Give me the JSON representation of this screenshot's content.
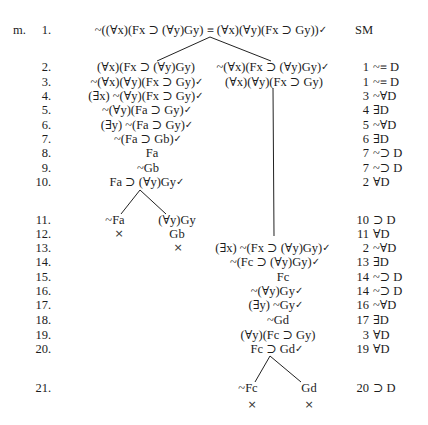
{
  "problem": {
    "label": "m."
  },
  "symbols": {
    "check": "✓"
  },
  "rows": [
    {
      "num": "1.",
      "nodes": [
        {
          "text": "~((∀x)(Fx ⊃ (∀y)Gy) ≡ (∀x)(∀y)(Fx ⊃ Gy))",
          "checked": true
        }
      ],
      "just": {
        "text": "SM"
      }
    },
    {
      "num": "2.",
      "nodes": [
        {
          "text": "(∀x)(Fx ⊃ (∀y)Gy)"
        },
        {
          "text": "~(∀x)(Fx ⊃ (∀y)Gy)",
          "checked": true
        }
      ],
      "just": {
        "ref": "1",
        "rule": "~≡ D"
      }
    },
    {
      "num": "3.",
      "nodes": [
        {
          "text": "~(∀x)(∀y)(Fx ⊃ Gy)",
          "checked": true
        },
        {
          "text": "(∀x)(∀y)(Fx ⊃ Gy)"
        }
      ],
      "just": {
        "ref": "1",
        "rule": "~≡ D"
      }
    },
    {
      "num": "4.",
      "nodes": [
        {
          "text": "(∃x) ~(∀y)(Fx ⊃ Gy)",
          "checked": true
        }
      ],
      "just": {
        "ref": "3",
        "rule": "~∀D"
      }
    },
    {
      "num": "5.",
      "nodes": [
        {
          "text": "~(∀y)(Fa ⊃ Gy)",
          "checked": true
        }
      ],
      "just": {
        "ref": "4",
        "rule": "∃D"
      }
    },
    {
      "num": "6.",
      "nodes": [
        {
          "text": "(∃y) ~(Fa ⊃ Gy)",
          "checked": true
        }
      ],
      "just": {
        "ref": "5",
        "rule": "~∀D"
      }
    },
    {
      "num": "7.",
      "nodes": [
        {
          "text": "~(Fa ⊃ Gb)",
          "checked": true
        }
      ],
      "just": {
        "ref": "6",
        "rule": "∃D"
      }
    },
    {
      "num": "8.",
      "nodes": [
        {
          "text": "Fa"
        }
      ],
      "just": {
        "ref": "7",
        "rule": "~⊃ D"
      }
    },
    {
      "num": "9.",
      "nodes": [
        {
          "text": "~Gb"
        }
      ],
      "just": {
        "ref": "7",
        "rule": "~⊃ D"
      }
    },
    {
      "num": "10.",
      "nodes": [
        {
          "text": "Fa ⊃ (∀y)Gy",
          "checked": true
        }
      ],
      "just": {
        "ref": "2",
        "rule": "∀D"
      }
    },
    {
      "num": "11.",
      "nodes": [
        {
          "text": "~Fa"
        },
        {
          "text": "(∀y)Gy"
        }
      ],
      "just": {
        "ref": "10",
        "rule": "⊃ D"
      }
    },
    {
      "num": "12.",
      "nodes": [
        {
          "text": "×"
        },
        {
          "text": "Gb"
        }
      ],
      "just": {
        "ref": "11",
        "rule": "∀D"
      }
    },
    {
      "num": "13.",
      "nodes": [
        {
          "text": "×"
        },
        {
          "text": "(∃x) ~(Fx ⊃ (∀y)Gy)",
          "checked": true
        }
      ],
      "just": {
        "ref": "2",
        "rule": "~∀D"
      }
    },
    {
      "num": "14.",
      "nodes": [
        {
          "text": "~(Fc ⊃ (∀y)Gy)",
          "checked": true
        }
      ],
      "just": {
        "ref": "13",
        "rule": "∃D"
      }
    },
    {
      "num": "15.",
      "nodes": [
        {
          "text": "Fc"
        }
      ],
      "just": {
        "ref": "14",
        "rule": "~⊃ D"
      }
    },
    {
      "num": "16.",
      "nodes": [
        {
          "text": "~(∀y)Gy",
          "checked": true
        }
      ],
      "just": {
        "ref": "14",
        "rule": "~⊃ D"
      }
    },
    {
      "num": "17.",
      "nodes": [
        {
          "text": "(∃y) ~Gy",
          "checked": true
        }
      ],
      "just": {
        "ref": "16",
        "rule": "~∀D"
      }
    },
    {
      "num": "18.",
      "nodes": [
        {
          "text": "~Gd"
        }
      ],
      "just": {
        "ref": "17",
        "rule": "∃D"
      }
    },
    {
      "num": "19.",
      "nodes": [
        {
          "text": "(∀y)(Fc ⊃ Gy)"
        }
      ],
      "just": {
        "ref": "3",
        "rule": "∀D"
      }
    },
    {
      "num": "20.",
      "nodes": [
        {
          "text": "Fc ⊃ Gd",
          "checked": true
        }
      ],
      "just": {
        "ref": "19",
        "rule": "∀D"
      }
    },
    {
      "num": "21.",
      "nodes": [
        {
          "text": "~Fc"
        },
        {
          "text": "Gd"
        }
      ],
      "just": {
        "ref": "20",
        "rule": "⊃ D"
      }
    },
    {
      "num": "",
      "nodes": [
        {
          "text": "×"
        },
        {
          "text": "×"
        }
      ]
    }
  ]
}
